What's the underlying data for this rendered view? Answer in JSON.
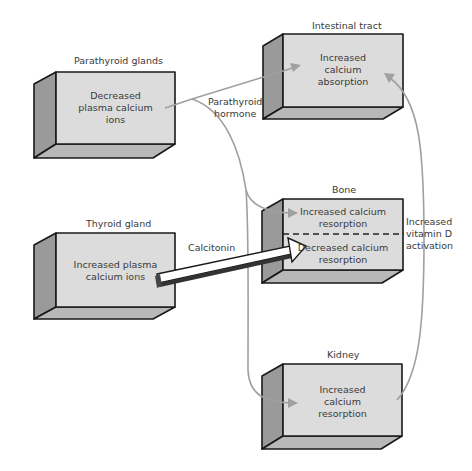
{
  "boxes": {
    "parathyroid": {
      "title": "Parathyroid glands",
      "lines": [
        "Decreased",
        "plasma calcium",
        "ions"
      ]
    },
    "intestinal": {
      "title": "Intestinal tract",
      "lines": [
        "Increased",
        "calcium",
        "absorption"
      ]
    },
    "bone": {
      "title": "Bone",
      "upper": [
        "Increased calcium",
        "resorption"
      ],
      "lower": [
        "Decreased calcium",
        "resorption"
      ]
    },
    "thyroid": {
      "title": "Thyroid gland",
      "lines": [
        "Increased plasma",
        "calcium ions"
      ]
    },
    "kidney": {
      "title": "Kidney",
      "lines": [
        "Increased",
        "calcium",
        "resorption"
      ]
    }
  },
  "connectors": {
    "parathyroid_hormone": [
      "Parathyroid",
      "hormone"
    ],
    "calcitonin": "Calcitonin",
    "vitamin_d": [
      "Increased",
      "vitamin D",
      "activation"
    ]
  },
  "colors": {
    "front_face": "#dcdcdc",
    "side_face": "#9a9a9a",
    "bottom_face": "#b8b8b8",
    "connector": "#a0a0a0",
    "outline": "#1a1a1a"
  }
}
